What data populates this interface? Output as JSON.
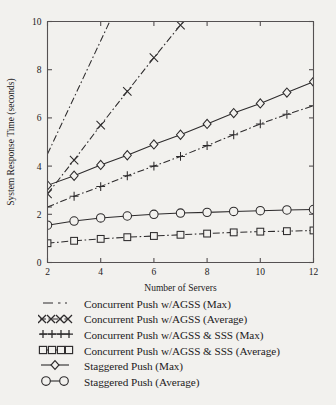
{
  "chart_data": {
    "type": "line",
    "title": "",
    "xlabel": "Number of Servers",
    "ylabel": "System Response Time (seconds)",
    "xlim": [
      2,
      12
    ],
    "ylim": [
      0,
      10
    ],
    "xticks": [
      2,
      4,
      6,
      8,
      10,
      12
    ],
    "yticks": [
      0,
      2,
      4,
      6,
      8,
      10
    ],
    "xticklabels": [
      "2",
      "4",
      "6",
      "8",
      "10",
      "12"
    ],
    "yticklabels": [
      "0",
      "2",
      "4",
      "6",
      "8",
      "10"
    ],
    "grid": false,
    "legend_position": "below-axes",
    "x": [
      2,
      3,
      4,
      5,
      6,
      7,
      8,
      9,
      10,
      11,
      12
    ],
    "series": [
      {
        "name": "Concurrent Push w/AGSS (Max)",
        "marker": "none",
        "linestyle": "dashdot",
        "values": [
          4.5,
          6.85,
          9.2,
          11.55,
          13.9,
          16.25,
          18.6,
          20.95,
          23.3,
          25.65,
          28.0
        ],
        "clipped_above_ylim": true
      },
      {
        "name": "Concurrent Push w/AGSS (Average)",
        "marker": "x",
        "linestyle": "dashdot",
        "values": [
          2.85,
          4.25,
          5.7,
          7.1,
          8.5,
          9.85,
          11.3,
          12.7,
          14.1,
          15.5,
          16.9
        ],
        "clipped_above_ylim": true
      },
      {
        "name": "Concurrent Push w/AGSS & SSS (Max)",
        "marker": "plus",
        "linestyle": "dashdot",
        "values": [
          2.3,
          2.75,
          3.15,
          3.6,
          4.0,
          4.4,
          4.85,
          5.3,
          5.75,
          6.15,
          6.5
        ]
      },
      {
        "name": "Concurrent Push w/AGSS & SSS (Average)",
        "marker": "square",
        "linestyle": "dashdot",
        "values": [
          0.8,
          0.9,
          0.98,
          1.05,
          1.1,
          1.15,
          1.2,
          1.25,
          1.28,
          1.3,
          1.33
        ]
      },
      {
        "name": "Staggered Push (Max)",
        "marker": "diamond",
        "linestyle": "solid",
        "values": [
          3.2,
          3.6,
          4.05,
          4.45,
          4.9,
          5.3,
          5.75,
          6.2,
          6.6,
          7.05,
          7.5
        ]
      },
      {
        "name": "Staggered Push (Average)",
        "marker": "circle",
        "linestyle": "solid",
        "values": [
          1.55,
          1.72,
          1.85,
          1.93,
          2.0,
          2.05,
          2.08,
          2.12,
          2.15,
          2.18,
          2.2
        ]
      }
    ]
  },
  "legend": {
    "items": [
      {
        "label": "Concurrent Push w/AGSS (Max)",
        "key": "dashdot-line-key"
      },
      {
        "label": "Concurrent Push w/AGSS (Average)",
        "key": "x-marker-key"
      },
      {
        "label": "Concurrent Push w/AGSS & SSS (Max)",
        "key": "plus-marker-key"
      },
      {
        "label": "Concurrent Push w/AGSS & SSS (Average)",
        "key": "square-marker-key"
      },
      {
        "label": "Staggered Push (Max)",
        "key": "diamond-marker-key"
      },
      {
        "label": "Staggered Push (Average)",
        "key": "circle-marker-key"
      }
    ]
  },
  "colors": {
    "background": "#f2f1ee",
    "ink": "#2d2b2c",
    "axis": "#555152"
  }
}
